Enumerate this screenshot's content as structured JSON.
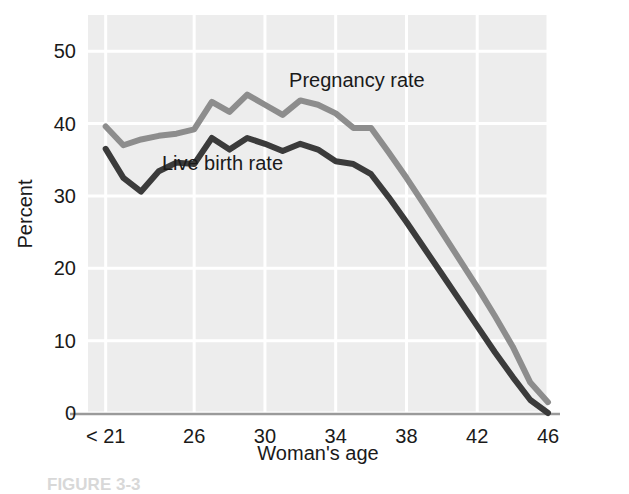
{
  "figure": {
    "caption_partial": "FIGURE 3-3"
  },
  "chart_data": {
    "type": "line",
    "title": "",
    "xlabel": "Woman's age",
    "ylabel": "Percent",
    "xlim": [
      20,
      46
    ],
    "ylim": [
      0,
      55
    ],
    "grid": true,
    "legend_position": "inline-annotation",
    "xtick_labels": [
      "< 21",
      "26",
      "30",
      "34",
      "38",
      "42",
      "46"
    ],
    "xtick_values": [
      21,
      26,
      30,
      34,
      38,
      42,
      46
    ],
    "ytick_labels": [
      "0",
      "10",
      "20",
      "30",
      "40",
      "50"
    ],
    "ytick_values": [
      0,
      10,
      20,
      30,
      40,
      50
    ],
    "x": [
      21,
      22,
      23,
      24,
      25,
      26,
      27,
      28,
      29,
      30,
      31,
      32,
      33,
      34,
      35,
      36,
      37,
      38,
      39,
      40,
      41,
      42,
      43,
      44,
      45,
      46
    ],
    "series": [
      {
        "name": "Pregnancy rate",
        "color": "#8d8d8d",
        "label_x": 35.2,
        "label_y": 45.0,
        "values": [
          39.6,
          37.0,
          37.8,
          38.3,
          38.6,
          39.2,
          43.0,
          41.6,
          44.0,
          42.6,
          41.2,
          43.2,
          42.6,
          41.4,
          39.4,
          39.4,
          36.0,
          32.5,
          28.8,
          25.0,
          21.2,
          17.4,
          13.4,
          9.2,
          4.2,
          1.5
        ]
      },
      {
        "name": "Live birth rate",
        "color": "#3b3b3b",
        "label_x": 27.6,
        "label_y": 33.6,
        "values": [
          36.5,
          32.5,
          30.6,
          33.4,
          34.6,
          34.4,
          38.0,
          36.4,
          38.0,
          37.2,
          36.2,
          37.2,
          36.4,
          34.8,
          34.4,
          33.0,
          29.8,
          26.4,
          22.8,
          19.2,
          15.6,
          12.0,
          8.4,
          5.0,
          1.8,
          0.0
        ]
      }
    ],
    "plot_area": {
      "left": 88,
      "top": 15,
      "right": 548,
      "bottom": 413
    },
    "style": {
      "plot_background": "#ededed",
      "gridline_color": "#ffffff",
      "axis_line_color": "#9a9a9a",
      "text_color": "#1a1a1a"
    }
  }
}
